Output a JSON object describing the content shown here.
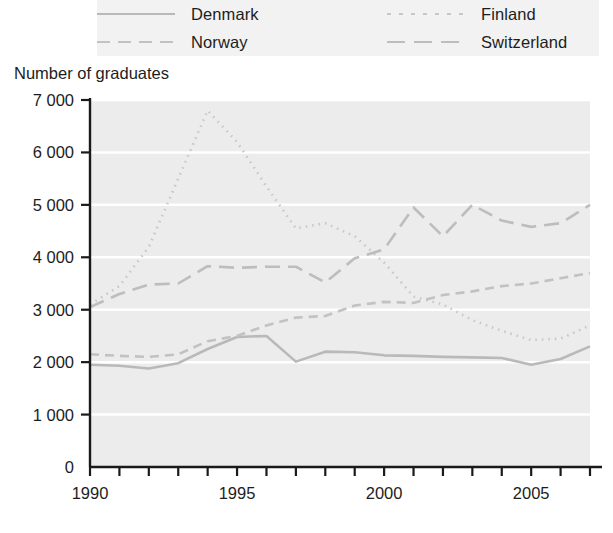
{
  "chart_data": {
    "type": "line",
    "title": "",
    "ylabel": "Number of graduates",
    "xlabel": "",
    "xlim": [
      1990,
      2007
    ],
    "ylim": [
      0,
      7000
    ],
    "grid": true,
    "legend_position": "top",
    "x": [
      1990,
      1991,
      1992,
      1993,
      1994,
      1995,
      1996,
      1997,
      1998,
      1999,
      2000,
      2001,
      2002,
      2003,
      2004,
      2005,
      2006,
      2007
    ],
    "xticks": [
      1990,
      1995,
      2000,
      2005
    ],
    "xtick_labels": [
      "1990",
      "1995",
      "2000",
      "2005"
    ],
    "yticks": [
      0,
      1000,
      2000,
      3000,
      4000,
      5000,
      6000,
      7000
    ],
    "ytick_labels": [
      "0",
      "1 000",
      "2 000",
      "3 000",
      "4 000",
      "5 000",
      "6 000",
      "7 000"
    ],
    "series": [
      {
        "name": "Denmark",
        "style": "solid",
        "color": "#b9b9b9",
        "values": [
          1950,
          1930,
          1880,
          1980,
          2250,
          2480,
          2500,
          2010,
          2200,
          2190,
          2130,
          2120,
          2100,
          2090,
          2080,
          1950,
          2060,
          2300
        ]
      },
      {
        "name": "Finland",
        "style": "dotted",
        "color": "#c7c7c7",
        "values": [
          3100,
          3450,
          4200,
          5500,
          6800,
          6200,
          5350,
          4550,
          4650,
          4400,
          3900,
          3250,
          3100,
          2800,
          2600,
          2420,
          2450,
          2700
        ]
      },
      {
        "name": "Norway",
        "style": "dashed",
        "color": "#c2c2c2",
        "values": [
          2150,
          2120,
          2100,
          2150,
          2400,
          2500,
          2700,
          2850,
          2880,
          3080,
          3150,
          3130,
          3280,
          3350,
          3450,
          3500,
          3600,
          3700
        ]
      },
      {
        "name": "Switzerland",
        "style": "long-dash",
        "color": "#bdbdbd",
        "values": [
          3050,
          3300,
          3480,
          3500,
          3830,
          3800,
          3820,
          3820,
          3520,
          3980,
          4150,
          4950,
          4400,
          5000,
          4700,
          4580,
          4650,
          5000
        ]
      }
    ]
  },
  "legend": {
    "items": [
      {
        "label": "Denmark",
        "swatch": "sw-denmark"
      },
      {
        "label": "Finland",
        "swatch": "sw-finland"
      },
      {
        "label": "Norway",
        "swatch": "sw-norway"
      },
      {
        "label": "Switzerland",
        "swatch": "sw-switzerland"
      }
    ]
  },
  "axis": {
    "y_title": "Number of graduates"
  },
  "colors": {
    "plot_background": "#ececec",
    "gridline": "#ffffff",
    "axis": "#1a1a1a",
    "legend_background": "#f2f2f2"
  }
}
